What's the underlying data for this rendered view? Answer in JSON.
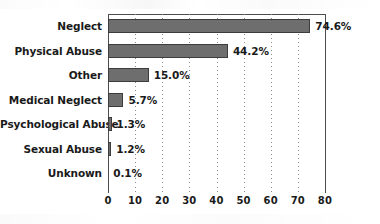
{
  "chart_data": {
    "type": "bar",
    "orientation": "horizontal",
    "title": "",
    "subtitle": "",
    "xlabel": "",
    "ylabel": "",
    "xlim": [
      0,
      80
    ],
    "xticks": [
      0,
      10,
      20,
      30,
      40,
      50,
      60,
      70,
      80
    ],
    "xtick_labels": [
      "0",
      "10",
      "20",
      "30",
      "40",
      "50",
      "60",
      "70",
      "80"
    ],
    "grid": "vertical-dotted",
    "legend": "none",
    "categories": [
      "Neglect",
      "Physical Abuse",
      "Other",
      "Medical Neglect",
      "Psychological Abuse",
      "Sexual Abuse",
      "Unknown"
    ],
    "values": [
      74.6,
      44.2,
      15.0,
      5.7,
      1.3,
      1.2,
      0.1
    ],
    "data_labels": [
      "74.6%",
      "44.2%",
      "15.0%",
      "5.7%",
      "1.3%",
      "1.2%",
      "0.1%"
    ],
    "bar_color": "#6e6e6e",
    "bar_edge_color": "#3d3d3d",
    "axis_color": "#4d4d4d",
    "gridline_color": "#8c8c8c",
    "background_color": "#ffffff",
    "text_color": "#1a1a1a"
  }
}
